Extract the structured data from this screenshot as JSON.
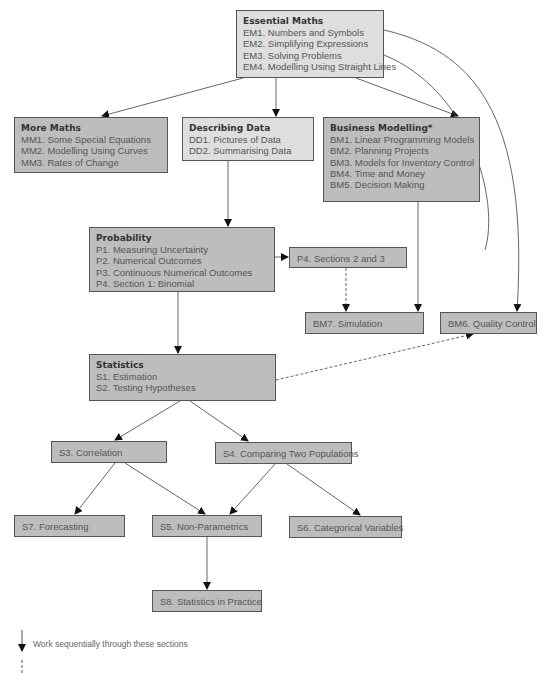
{
  "colors": {
    "light_box": "#dedede",
    "dark_box": "#bdbdbd",
    "border": "#555555",
    "line": "#555555"
  },
  "boxes": {
    "essential_maths": {
      "title": "Essential Maths",
      "items": [
        "EM1. Numbers and Symbols",
        "EM2. Simplifying Expressions",
        "EM3. Solving Problems",
        "EM4. Modelling Using Straight Lines"
      ],
      "sequential": true
    },
    "more_maths": {
      "title": "More Maths",
      "items": [
        "MM1. Some Special Equations",
        "MM2. Modelling Using Curves",
        "MM3. Rates of Change"
      ],
      "sequential": true
    },
    "describing_data": {
      "title": "Describing Data",
      "items": [
        "DD1. Pictures of Data",
        "DD2. Summarising Data"
      ],
      "sequential": true
    },
    "business_modelling": {
      "title": "Business Modelling*",
      "items": [
        "BM1. Linear Programming Models",
        "BM2. Planning Projects",
        "BM3. Models for Inventory Control",
        "BM4. Time and Money",
        "BM5. Decision Making"
      ]
    },
    "probability": {
      "title": "Probability",
      "items": [
        "P1. Measuring Uncertainty",
        "P2. Numerical Outcomes",
        "P3. Continuous Numerical Outcomes",
        "P4. Section 1: Binomial"
      ],
      "sequential": true
    },
    "p4_sections": {
      "label": "P4. Sections 2 and 3"
    },
    "bm7": {
      "label": "BM7. Simulation"
    },
    "bm6": {
      "label": "BM6. Quality Control"
    },
    "statistics": {
      "title": "Statistics",
      "items": [
        "S1. Estimation",
        "S2. Testing Hypotheses"
      ],
      "sequential": true
    },
    "s3": {
      "label": "S3. Correlation"
    },
    "s4": {
      "label": "S4. Comparing Two Populations"
    },
    "s7": {
      "label": "S7. Forecasting"
    },
    "s5": {
      "label": "S5. Non-Parametrics"
    },
    "s6": {
      "label": "S6. Categorical Variables"
    },
    "s8": {
      "label": "S8. Statistics in Practice"
    }
  },
  "legend": {
    "solid_arrow_label": "Work sequentially through these sections",
    "dashed_arrow_label": ""
  }
}
